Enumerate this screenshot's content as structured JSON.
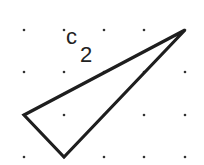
{
  "diagram": {
    "type": "dot-grid-triangle",
    "grid": {
      "columns_x": [
        24,
        64,
        104,
        144,
        185
      ],
      "rows_y": [
        30,
        72,
        115,
        157
      ],
      "dot_color": "#333333",
      "dot_radius": 1.3
    },
    "shape": {
      "name": "triangle",
      "label": "c",
      "label_subscript": "2",
      "stroke_color": "#1e1e1e",
      "stroke_width": 3.2,
      "vertices": [
        {
          "x": 185,
          "y": 30
        },
        {
          "x": 24,
          "y": 115
        },
        {
          "x": 64,
          "y": 157
        }
      ],
      "grid_vertices": [
        {
          "col": 4,
          "row": 0
        },
        {
          "col": 0,
          "row": 2
        },
        {
          "col": 1,
          "row": 3
        }
      ]
    }
  }
}
